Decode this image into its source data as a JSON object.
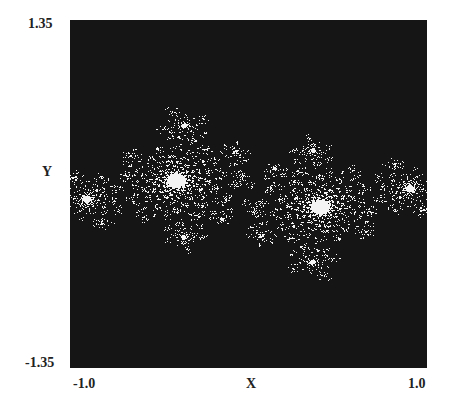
{
  "chart_data": {
    "type": "heatmap",
    "title": "",
    "xlabel": "X",
    "ylabel": "Y",
    "xlim": [
      -1.0,
      1.0
    ],
    "ylim": [
      -1.35,
      1.35
    ],
    "x_tick_labels": [
      "-1.0",
      "1.0"
    ],
    "y_tick_labels": [
      "1.35",
      "-1.35"
    ],
    "grid": false,
    "legend": null,
    "colors": {
      "inside": "#f4f4f4",
      "outside": "#151515",
      "page": "#ffffff"
    },
    "render": {
      "c_re": -0.4,
      "c_im": 0.6,
      "rotation_deg": -28,
      "scale": 0.82,
      "max_iter": 120
    }
  },
  "labels": {
    "y_top": "1.35",
    "y_bottom": "-1.35",
    "y_axis": "Y",
    "x_left": "-1.0",
    "x_right": "1.0",
    "x_axis": "X"
  }
}
